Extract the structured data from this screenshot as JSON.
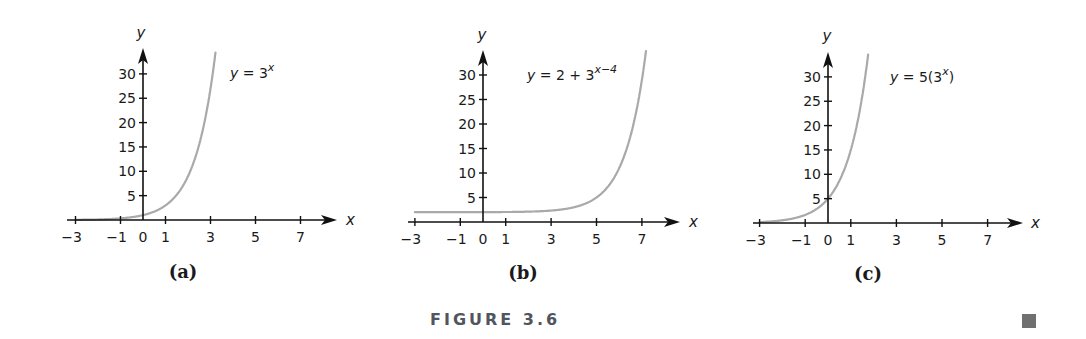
{
  "figure": {
    "caption": "FIGURE 3.6",
    "end_mark_color": "#707070",
    "curve_color": "#a9a9a9",
    "axis_color": "#111111"
  },
  "chart_data": [
    {
      "type": "line",
      "panel": "(a)",
      "title": "",
      "equation": {
        "lhs": "y",
        "base": "= 3",
        "sup": "x"
      },
      "formula": "3^x",
      "xlabel": "x",
      "ylabel": "y",
      "x_ticks": [
        -3,
        -1,
        0,
        1,
        3,
        5,
        7
      ],
      "y_ticks": [
        5,
        10,
        15,
        20,
        25,
        30
      ],
      "xlim": [
        -3,
        8
      ],
      "ylim": [
        0,
        35
      ],
      "grid": false,
      "series": [
        {
          "name": "y = 3^x",
          "x": [
            -3,
            -2,
            -1,
            0,
            1,
            2,
            3,
            3.23
          ],
          "y": [
            0.04,
            0.11,
            0.33,
            1,
            3,
            9,
            27,
            34.8
          ]
        }
      ],
      "layout": {
        "origin": [
          143,
          220
        ],
        "sx": 22.5,
        "sy": 4.87,
        "x_start": 67,
        "x_end": 337,
        "y_top": 48,
        "eq_pos": [
          230,
          78
        ],
        "panel_pos": [
          183,
          278
        ],
        "ylabel_pos": [
          141,
          38
        ],
        "xlabel_pos": [
          346,
          225
        ]
      }
    },
    {
      "type": "line",
      "panel": "(b)",
      "title": "",
      "equation": {
        "lhs": "y",
        "base": "= 2 + 3",
        "sup": "x−4"
      },
      "formula": "2+3^(x-4)",
      "xlabel": "x",
      "ylabel": "y",
      "x_ticks": [
        -3,
        -1,
        0,
        1,
        3,
        5,
        7
      ],
      "y_ticks": [
        5,
        10,
        15,
        20,
        25,
        30
      ],
      "xlim": [
        -3,
        8
      ],
      "ylim": [
        0,
        35
      ],
      "grid": false,
      "series": [
        {
          "name": "y = 2 + 3^(x-4)",
          "x": [
            -3,
            0,
            3,
            4,
            5,
            6,
            7,
            7.18
          ],
          "y": [
            2.0,
            2.01,
            2.33,
            3,
            5,
            11,
            29,
            35
          ]
        }
      ],
      "layout": {
        "origin": [
          483,
          222
        ],
        "sx": 22.7,
        "sy": 4.9,
        "x_start": 408,
        "x_end": 680,
        "y_top": 50,
        "eq_pos": [
          527,
          80
        ],
        "panel_pos": [
          523,
          279
        ],
        "ylabel_pos": [
          482,
          40
        ],
        "xlabel_pos": [
          689,
          227
        ]
      }
    },
    {
      "type": "line",
      "panel": "(c)",
      "title": "",
      "equation": {
        "lhs": "y",
        "base": "= 5(3",
        "sup": "x",
        "tail": ")"
      },
      "formula": "5*3^x",
      "xlabel": "x",
      "ylabel": "y",
      "x_ticks": [
        -3,
        -1,
        0,
        1,
        3,
        5,
        7
      ],
      "y_ticks": [
        5,
        10,
        15,
        20,
        25,
        30
      ],
      "xlim": [
        -3,
        8
      ],
      "ylim": [
        0,
        35
      ],
      "grid": false,
      "series": [
        {
          "name": "y = 5(3^x)",
          "x": [
            -3,
            -2,
            -1,
            0,
            1,
            1.5,
            1.77
          ],
          "y": [
            0.19,
            0.56,
            1.67,
            5,
            15,
            26,
            35
          ]
        }
      ],
      "layout": {
        "origin": [
          828,
          223
        ],
        "sx": 22.8,
        "sy": 4.87,
        "x_start": 753,
        "x_end": 1023,
        "y_top": 52,
        "eq_pos": [
          890,
          82
        ],
        "panel_pos": [
          868,
          280
        ],
        "ylabel_pos": [
          827,
          41
        ],
        "xlabel_pos": [
          1031,
          228
        ]
      }
    }
  ]
}
